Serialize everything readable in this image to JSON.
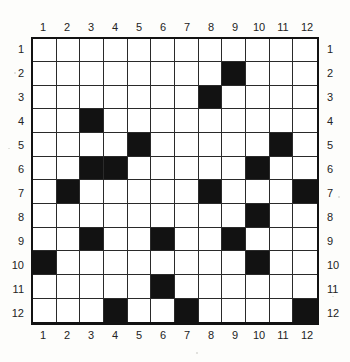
{
  "figure": {
    "name": "12x12-binary-grid",
    "rows": 12,
    "cols": 12,
    "colors": {
      "filled": "#121212",
      "empty": "#ffffff",
      "gridline": "#2a2a2a",
      "border": "#121212",
      "label": "#232323",
      "background": "#fdfdfb"
    }
  },
  "axes": {
    "top_labels": [
      "1",
      "2",
      "3",
      "4",
      "5",
      "6",
      "7",
      "8",
      "9",
      "10",
      "11",
      "12"
    ],
    "bottom_labels": [
      "1",
      "2",
      "3",
      "4",
      "5",
      "6",
      "7",
      "8",
      "9",
      "10",
      "11",
      "12"
    ],
    "left_labels": [
      "1",
      "2",
      "3",
      "4",
      "5",
      "6",
      "7",
      "8",
      "9",
      "10",
      "11",
      "12"
    ],
    "right_labels": [
      "1",
      "2",
      "3",
      "4",
      "5",
      "6",
      "7",
      "8",
      "9",
      "10",
      "11",
      "12"
    ]
  },
  "chart_data": {
    "type": "heatmap",
    "title": "",
    "xlabel": "",
    "ylabel": "",
    "categories": [
      "1",
      "2",
      "3",
      "4",
      "5",
      "6",
      "7",
      "8",
      "9",
      "10",
      "11",
      "12"
    ],
    "row_categories": [
      "1",
      "2",
      "3",
      "4",
      "5",
      "6",
      "7",
      "8",
      "9",
      "10",
      "11",
      "12"
    ],
    "legend": [],
    "grid": true,
    "values": [
      [
        0,
        0,
        0,
        0,
        0,
        0,
        0,
        0,
        0,
        0,
        0,
        0
      ],
      [
        0,
        0,
        0,
        0,
        0,
        0,
        0,
        0,
        1,
        0,
        0,
        0
      ],
      [
        0,
        0,
        0,
        0,
        0,
        0,
        0,
        1,
        0,
        0,
        0,
        0
      ],
      [
        0,
        0,
        1,
        0,
        0,
        0,
        0,
        0,
        0,
        0,
        0,
        0
      ],
      [
        0,
        0,
        0,
        0,
        1,
        0,
        0,
        0,
        0,
        0,
        1,
        0
      ],
      [
        0,
        0,
        1,
        1,
        0,
        0,
        0,
        0,
        0,
        1,
        0,
        0
      ],
      [
        0,
        1,
        0,
        0,
        0,
        0,
        0,
        1,
        0,
        0,
        0,
        1
      ],
      [
        0,
        0,
        0,
        0,
        0,
        0,
        0,
        0,
        0,
        1,
        0,
        0
      ],
      [
        0,
        0,
        1,
        0,
        0,
        1,
        0,
        0,
        1,
        0,
        0,
        0
      ],
      [
        1,
        0,
        0,
        0,
        0,
        0,
        0,
        0,
        0,
        1,
        0,
        0
      ],
      [
        0,
        0,
        0,
        0,
        0,
        1,
        0,
        0,
        0,
        0,
        0,
        0
      ],
      [
        0,
        0,
        0,
        1,
        0,
        0,
        1,
        0,
        0,
        0,
        0,
        1
      ]
    ],
    "filled_cells": [
      {
        "row": 2,
        "col": 9
      },
      {
        "row": 3,
        "col": 8
      },
      {
        "row": 4,
        "col": 3
      },
      {
        "row": 5,
        "col": 5
      },
      {
        "row": 5,
        "col": 11
      },
      {
        "row": 6,
        "col": 3
      },
      {
        "row": 6,
        "col": 4
      },
      {
        "row": 6,
        "col": 10
      },
      {
        "row": 7,
        "col": 2
      },
      {
        "row": 7,
        "col": 8
      },
      {
        "row": 7,
        "col": 12
      },
      {
        "row": 8,
        "col": 10
      },
      {
        "row": 9,
        "col": 3
      },
      {
        "row": 9,
        "col": 6
      },
      {
        "row": 9,
        "col": 9
      },
      {
        "row": 10,
        "col": 1
      },
      {
        "row": 10,
        "col": 10
      },
      {
        "row": 11,
        "col": 6
      },
      {
        "row": 12,
        "col": 4
      },
      {
        "row": 12,
        "col": 7
      },
      {
        "row": 12,
        "col": 12
      }
    ],
    "filled_count": 21,
    "total_cells": 144
  }
}
